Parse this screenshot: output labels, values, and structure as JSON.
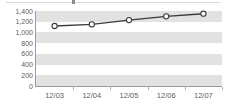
{
  "chart_data": {
    "type": "line",
    "title": "",
    "subtitle": "",
    "xlabel": "",
    "ylabel": "",
    "categories": [
      "12/03",
      "12/04",
      "12/05",
      "12/06",
      "12/07"
    ],
    "series": [
      {
        "name": "series-1",
        "values": [
          1120,
          1150,
          1230,
          1300,
          1350
        ]
      }
    ],
    "ylim": [
      0,
      1400
    ],
    "yticks": [
      0,
      200,
      400,
      600,
      800,
      1000,
      1200,
      1400
    ],
    "ytick_labels": [
      "0",
      "200",
      "400",
      "600",
      "800",
      "1,000",
      "1,200",
      "1,400"
    ],
    "grid": "horizontal-banded",
    "legend": "none",
    "marker": "open-circle",
    "line_color": "#3a3a3a",
    "marker_fill": "#ffffff",
    "marker_stroke": "#3a3a3a",
    "band_color": "#e2e2e2",
    "plot_background": "#ffffff",
    "axis_color": "#9a9a9a",
    "label_color": "#5c5c5c"
  },
  "axis": {
    "y_labels": [
      "1,400",
      "1,200",
      "1,000",
      "800",
      "600",
      "400",
      "200",
      "0"
    ],
    "x_labels": [
      "12/03",
      "12/04",
      "12/05",
      "12/06",
      "12/07"
    ]
  }
}
